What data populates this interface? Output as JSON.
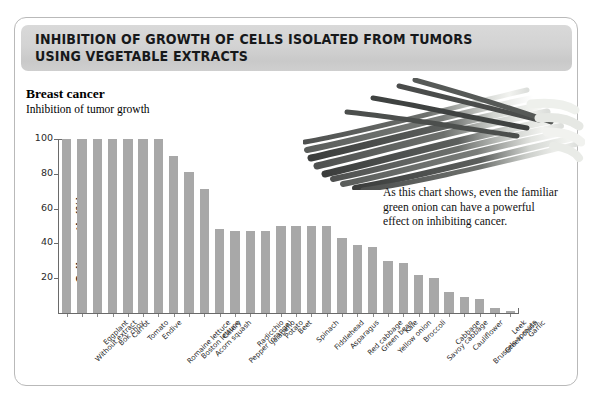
{
  "header": {
    "title": "INHIBITION OF GROWTH OF CELLS ISOLATED FROM TUMORS\nUSING VEGETABLE EXTRACTS"
  },
  "chart_header": {
    "title": "Breast cancer",
    "subtitle": "Inhibition of tumor growth"
  },
  "caption": {
    "text": "As this chart shows, even the familiar green onion can have a powerful effect on inhibiting cancer."
  },
  "photo": {
    "alt_name": "green-onions-photo"
  },
  "colors": {
    "bar": "#a8a8a8",
    "axis": "#6a6a6a",
    "header_band": "#d3d3d3",
    "card_border": "#b9b9b9"
  },
  "chart_data": {
    "type": "bar",
    "title": "Breast cancer",
    "subtitle": "Inhibition of tumor growth",
    "xlabel": "",
    "ylabel": "Cell growth (%)",
    "ylim": [
      0,
      100
    ],
    "yticks": [
      20,
      40,
      60,
      80,
      100
    ],
    "grid": false,
    "legend": "none",
    "categories": [
      "Without extract",
      "Eggplant",
      "Bok choy",
      "Carrot",
      "Tomato",
      "Endive",
      "Romaine lettuce",
      "Boston lettuce",
      "Acorn squash",
      "Celery",
      "Pepper (orange)",
      "Radicchio",
      "Jalapeño",
      "Potato",
      "Beet",
      "Spinach",
      "Fiddlehead",
      "Asparagus",
      "Red cabbage",
      "Green bean",
      "Yellow onion",
      "Kale",
      "Broccoli",
      "Savoy cabbage",
      "Cabbage",
      "Cauliflower",
      "Brussels sprouts",
      "Green onion",
      "Leek",
      "Garlic"
    ],
    "values": [
      100,
      100,
      100,
      100,
      100,
      100,
      100,
      90,
      81,
      71,
      48,
      47,
      47,
      47,
      50,
      50,
      50,
      50,
      43,
      39,
      38,
      30,
      29,
      22,
      20,
      12,
      9,
      8,
      3,
      1
    ]
  }
}
